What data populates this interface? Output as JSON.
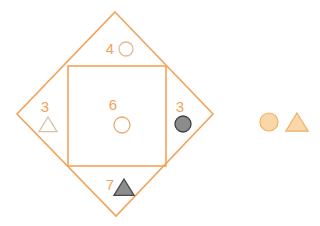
{
  "figure": {
    "background_color": "#ffffff",
    "palette": {
      "outline_orange": "#F4A259",
      "label_orange": "#F5A25D",
      "light_outline": "#E8C9A8",
      "legend_fill": "#FAD7A8",
      "legend_stroke": "#F0B06A",
      "gray_fill": "#8C8C8C",
      "gray_stroke": "#4A4A4A"
    },
    "shapes": {
      "diamond": {
        "name": "diamond",
        "stroke": "#F4A259",
        "fill": "none",
        "stroke_width": 1.6,
        "points": "115,12 213,114 116,216 17,114"
      },
      "square": {
        "name": "square",
        "stroke": "#F4A259",
        "fill": "none",
        "stroke_width": 1.6,
        "x": 68,
        "y": 66,
        "width": 98,
        "height": 100
      }
    },
    "regions": [
      {
        "id": "top",
        "label": "4",
        "label_x": 110,
        "label_y": 54,
        "marker": {
          "type": "circle",
          "style": "open",
          "cx": 126,
          "cy": 49,
          "r": 7,
          "fill": "none",
          "stroke": "#E8B894"
        }
      },
      {
        "id": "left",
        "label": "3",
        "label_x": 45,
        "label_y": 112,
        "marker": {
          "type": "triangle",
          "style": "open",
          "cx": 48,
          "cy": 125,
          "r": 8,
          "fill": "none",
          "stroke": "#DCC0A4"
        }
      },
      {
        "id": "center",
        "label": "6",
        "label_x": 113,
        "label_y": 110,
        "marker": {
          "type": "circle",
          "style": "open",
          "cx": 122,
          "cy": 125,
          "r": 8,
          "fill": "none",
          "stroke": "#E8A96A"
        }
      },
      {
        "id": "right",
        "label": "3",
        "label_x": 180,
        "label_y": 112,
        "marker": {
          "type": "circle",
          "style": "filled",
          "cx": 183,
          "cy": 124,
          "r": 8,
          "fill": "#8C8C8C",
          "stroke": "#3F3F3F"
        }
      },
      {
        "id": "bottom",
        "label": "7",
        "label_x": 110,
        "label_y": 190,
        "marker": {
          "type": "triangle",
          "style": "filled",
          "cx": 124,
          "cy": 188,
          "r": 9,
          "fill": "#8C8C8C",
          "stroke": "#4A4A4A"
        }
      }
    ],
    "legend": {
      "name": "legend",
      "items": [
        {
          "id": "legend-circle",
          "type": "circle",
          "cx": 269,
          "cy": 122,
          "r": 9,
          "fill": "#FAD7A8",
          "stroke": "#F0B06A"
        },
        {
          "id": "legend-triangle",
          "type": "triangle",
          "cx": 297,
          "cy": 123,
          "r": 10,
          "fill": "#FAD7A8",
          "stroke": "#F0B06A"
        }
      ]
    }
  }
}
